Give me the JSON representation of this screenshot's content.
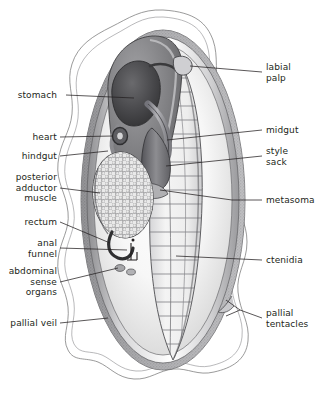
{
  "figure": {
    "width": 327,
    "height": 401,
    "background_color": "#ffffff",
    "line_color": "#231f20",
    "text_color": "#231f20"
  },
  "labels": {
    "left": [
      {
        "id": "stomach",
        "text": "stomach",
        "lines": 1
      },
      {
        "id": "heart",
        "text": "heart",
        "lines": 1
      },
      {
        "id": "hindgut",
        "text": "hindgut",
        "lines": 1
      },
      {
        "id": "posterior-adductor-muscle",
        "text": "posterior\nadductor\nmuscle",
        "lines": 3
      },
      {
        "id": "rectum",
        "text": "rectum",
        "lines": 1
      },
      {
        "id": "anal-funnel",
        "text": "anal\nfunnel",
        "lines": 2
      },
      {
        "id": "abdominal-sense-organs",
        "text": "abdominal\nsense\norgans",
        "lines": 3
      },
      {
        "id": "pallial-veil",
        "text": "pallial veil",
        "lines": 1
      }
    ],
    "right": [
      {
        "id": "labial-palp",
        "text": "labial\npalp",
        "lines": 2
      },
      {
        "id": "midgut",
        "text": "midgut",
        "lines": 1
      },
      {
        "id": "style-sack",
        "text": "style\nsack",
        "lines": 2
      },
      {
        "id": "metasoma",
        "text": "metasoma",
        "lines": 1
      },
      {
        "id": "ctenidia",
        "text": "ctenidia",
        "lines": 1
      },
      {
        "id": "pallial-tentacles",
        "text": "pallial\ntentacles",
        "lines": 2
      }
    ]
  },
  "structures": [
    {
      "id": "pallial-veil",
      "name": "pallial veil",
      "description": "outer wavy mantle margin outline",
      "fill": "#ffffff",
      "stroke": "#6f6f6f"
    },
    {
      "id": "mantle-rim",
      "name": "mantle rim",
      "description": "stippled grey band bordering the body",
      "fill": "#b9b9b9"
    },
    {
      "id": "mantle-cavity",
      "name": "mantle cavity",
      "description": "pale graded interior of the shell",
      "fill": "#f2f2f2"
    },
    {
      "id": "visceral-mass",
      "name": "visceral mass",
      "description": "dark grey upper body mass",
      "fill": "#77777a"
    },
    {
      "id": "stomach",
      "name": "stomach",
      "description": "dark rounded organ in visceral mass",
      "fill": "#4a4a4d"
    },
    {
      "id": "midgut",
      "name": "midgut",
      "description": "tube descending from stomach",
      "fill": "#8c8c8f"
    },
    {
      "id": "style-sack",
      "name": "style sack",
      "description": "elongate sac below midgut",
      "fill": "#6d6d70"
    },
    {
      "id": "labial-palp",
      "name": "labial palp",
      "description": "small triangular flap at anterior gill tip",
      "fill": "#cfcfcf"
    },
    {
      "id": "heart",
      "name": "heart",
      "description": "small dark ring anterior to adductor",
      "fill": "#5a5a5d"
    },
    {
      "id": "hindgut",
      "name": "hindgut",
      "description": "duct curving behind the heart",
      "fill": "#8a8a8d"
    },
    {
      "id": "posterior-adductor-muscle",
      "name": "posterior adductor muscle",
      "description": "oval mass with polygonal cell stipple",
      "fill": "#e6e6e6"
    },
    {
      "id": "rectum",
      "name": "rectum",
      "description": "dark hooked tube below adductor",
      "fill": "#2f2f31"
    },
    {
      "id": "anal-funnel",
      "name": "anal funnel",
      "description": "small bracket with terminal dot",
      "fill": "#231f20"
    },
    {
      "id": "abdominal-sense-organs",
      "name": "abdominal sense organs",
      "description": "paired patches posterior to adductor",
      "fill": "#9a9a9d"
    },
    {
      "id": "metasoma",
      "name": "metasoma",
      "description": "posterior body region at gill junction",
      "fill": "#b5b5b8"
    },
    {
      "id": "ctenidia",
      "name": "ctenidia",
      "description": "large striated gill leaf with ~20 filaments",
      "fill": "#efefef"
    },
    {
      "id": "pallial-tentacles",
      "name": "pallial tentacles",
      "description": "fringe on posterior mantle margin",
      "fill": "#c8c8c8"
    }
  ]
}
